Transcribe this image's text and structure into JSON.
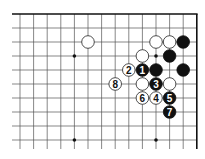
{
  "diagram": {
    "type": "go-board-fragment",
    "corner": "top-right",
    "columns_visible": 14,
    "rows_visible": 10,
    "colors": {
      "line": "#555555",
      "edge": "#111111",
      "black_stone": "#111111",
      "white_stone": "#ffffff",
      "white_stone_outline": "#222222",
      "black_label": "#ffffff",
      "white_label": "#111111"
    },
    "star_points": [
      {
        "col": 4,
        "row": 3
      },
      {
        "col": 10,
        "row": 3
      },
      {
        "col": 4,
        "row": 9
      },
      {
        "col": 10,
        "row": 9
      }
    ],
    "stones": [
      {
        "color": "white",
        "col": 5,
        "row": 2,
        "label": ""
      },
      {
        "color": "white",
        "col": 10,
        "row": 2,
        "label": ""
      },
      {
        "color": "white",
        "col": 11,
        "row": 2,
        "label": ""
      },
      {
        "color": "black",
        "col": 12,
        "row": 2,
        "label": ""
      },
      {
        "color": "white",
        "col": 9,
        "row": 3,
        "label": ""
      },
      {
        "color": "black",
        "col": 11,
        "row": 3,
        "label": ""
      },
      {
        "color": "white",
        "col": 8,
        "row": 4,
        "label": "2"
      },
      {
        "color": "black",
        "col": 9,
        "row": 4,
        "label": "1"
      },
      {
        "color": "black",
        "col": 10,
        "row": 4,
        "label": ""
      },
      {
        "color": "black",
        "col": 12,
        "row": 4,
        "label": ""
      },
      {
        "color": "white",
        "col": 7,
        "row": 5,
        "label": "8"
      },
      {
        "color": "white",
        "col": 9,
        "row": 5,
        "label": ""
      },
      {
        "color": "black",
        "col": 10,
        "row": 5,
        "label": "3"
      },
      {
        "color": "white",
        "col": 11,
        "row": 5,
        "label": ""
      },
      {
        "color": "white",
        "col": 9,
        "row": 6,
        "label": "6"
      },
      {
        "color": "white",
        "col": 10,
        "row": 6,
        "label": "4"
      },
      {
        "color": "black",
        "col": 11,
        "row": 6,
        "label": "5"
      },
      {
        "color": "black",
        "col": 11,
        "row": 7,
        "label": "7"
      }
    ]
  }
}
